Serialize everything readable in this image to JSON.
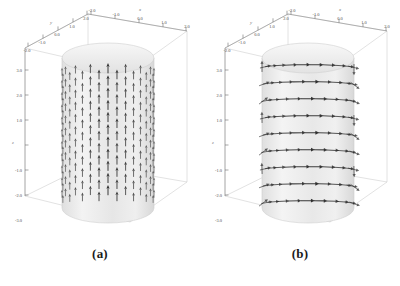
{
  "figure": {
    "background_color": "#ffffff",
    "box_edge_color": "#c9c9c9",
    "axis_line_color": "#8c8c8c",
    "tick_color": "#6b6b6b",
    "tick_label_color": "#4a4a4a",
    "cylinder_fill": "#ededed",
    "cylinder_edge": "#cfcfcf",
    "arrow_color": "#2b2b2b"
  },
  "panels": [
    {
      "id": "a",
      "caption": "(a)",
      "field_description": "axial vector field on cylinder surface",
      "arrow_style": "vertical",
      "arrow_count": 310,
      "axes": {
        "x": {
          "label": "x",
          "ticks": [
            "-2.0",
            "-1.0",
            "0.0",
            "1.0",
            "2.0"
          ],
          "values": [
            -2.0,
            -1.0,
            0.0,
            1.0,
            2.0
          ],
          "range": [
            -2.0,
            2.0
          ]
        },
        "y": {
          "label": "y",
          "ticks": [
            "-2.0",
            "-1.0",
            "0.0",
            "1.0",
            "2.0"
          ],
          "values": [
            -2.0,
            -1.0,
            0.0,
            1.0,
            2.0
          ],
          "range": [
            -2.0,
            2.0
          ]
        },
        "z": {
          "label": "z",
          "ticks": [
            "3.0",
            "2.0",
            "1.0",
            "-1.0",
            "-2.0",
            "-3.0"
          ],
          "values": [
            3.0,
            2.0,
            1.0,
            -1.0,
            -2.0,
            -3.0
          ],
          "range": [
            -3.0,
            3.0
          ]
        }
      }
    },
    {
      "id": "b",
      "caption": "(b)",
      "field_description": "azimuthal vector field on cylinder surface",
      "arrow_style": "circumferential",
      "arrow_count": 190,
      "axes": {
        "x": {
          "label": "x",
          "ticks": [
            "-2.0",
            "-1.0",
            "0.0",
            "1.0",
            "2.0"
          ],
          "values": [
            -2.0,
            -1.0,
            0.0,
            1.0,
            2.0
          ],
          "range": [
            -2.0,
            2.0
          ]
        },
        "y": {
          "label": "y",
          "ticks": [
            "-2.0",
            "-1.0",
            "0.0",
            "1.0",
            "2.0"
          ],
          "values": [
            -2.0,
            -1.0,
            0.0,
            1.0,
            2.0
          ],
          "range": [
            -2.0,
            2.0
          ]
        },
        "z": {
          "label": "z",
          "ticks": [
            "3.0",
            "2.0",
            "1.0",
            "-1.0",
            "-2.0",
            "-3.0"
          ],
          "values": [
            3.0,
            2.0,
            1.0,
            -1.0,
            -2.0,
            -3.0
          ],
          "range": [
            -3.0,
            3.0
          ]
        }
      }
    }
  ],
  "chart_data": {
    "type": "scatter",
    "title": "",
    "xlabel": "x",
    "ylabel": "y",
    "zlabel": "z",
    "xlim": [
      -2.0,
      2.0
    ],
    "ylim": [
      -2.0,
      2.0
    ],
    "zlim": [
      -3.0,
      3.0
    ],
    "grid": false,
    "legend": "none",
    "subplots": [
      {
        "name": "(a)",
        "render": "3d-quiver-on-cylinder",
        "cylinder_radius": 1.5,
        "cylinder_height": 6.0,
        "vector_direction": "+z (axial)",
        "rows": 22,
        "columns": 16
      },
      {
        "name": "(b)",
        "render": "3d-quiver-on-cylinder",
        "cylinder_radius": 1.5,
        "cylinder_height": 6.0,
        "vector_direction": "tangential (azimuthal)",
        "rows": 9,
        "columns": 22
      }
    ]
  }
}
